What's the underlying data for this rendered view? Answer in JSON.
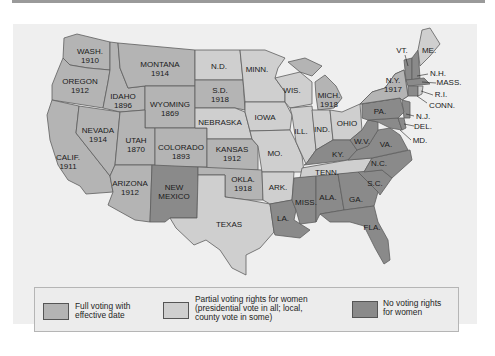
{
  "map": {
    "colors": {
      "full": "#b4b4b4",
      "partial": "#cfcfcf",
      "none": "#8a8a8a",
      "border": "#5e5e5e",
      "water": "#efefef",
      "lakes": "#f4f4f4"
    },
    "states": {
      "wash": {
        "name": "WASH.",
        "year": "1910",
        "status": "full"
      },
      "oregon": {
        "name": "OREGON",
        "year": "1912",
        "status": "full"
      },
      "calif": {
        "name": "CALIF.",
        "year": "1911",
        "status": "full"
      },
      "idaho": {
        "name": "IDAHO",
        "year": "1896",
        "status": "full"
      },
      "nevada": {
        "name": "NEVADA",
        "year": "1914",
        "status": "full"
      },
      "montana": {
        "name": "MONTANA",
        "year": "1914",
        "status": "full"
      },
      "wyoming": {
        "name": "WYOMING",
        "year": "1869",
        "status": "full"
      },
      "utah": {
        "name": "UTAH",
        "year": "1870",
        "status": "full"
      },
      "colorado": {
        "name": "COLORADO",
        "year": "1893",
        "status": "full"
      },
      "arizona": {
        "name": "ARIZONA",
        "year": "1912",
        "status": "full"
      },
      "new_mexico": {
        "name": "NEW MEXICO",
        "status": "none"
      },
      "nd": {
        "name": "N.D.",
        "status": "partial"
      },
      "sd": {
        "name": "S.D.",
        "year": "1918",
        "status": "full"
      },
      "nebraska": {
        "name": "NEBRASKA",
        "status": "partial"
      },
      "kansas": {
        "name": "KANSAS",
        "year": "1912",
        "status": "full"
      },
      "okla": {
        "name": "OKLA.",
        "year": "1918",
        "status": "full"
      },
      "texas": {
        "name": "TEXAS",
        "status": "partial"
      },
      "minn": {
        "name": "MINN.",
        "status": "partial"
      },
      "iowa": {
        "name": "IOWA",
        "status": "partial"
      },
      "mo": {
        "name": "MO.",
        "status": "partial"
      },
      "ark": {
        "name": "ARK.",
        "status": "partial"
      },
      "la": {
        "name": "LA.",
        "status": "none"
      },
      "wis": {
        "name": "WIS.",
        "status": "partial"
      },
      "ill": {
        "name": "ILL.",
        "status": "partial"
      },
      "mich": {
        "name": "MICH.",
        "year": "1918",
        "status": "full"
      },
      "ind": {
        "name": "IND.",
        "status": "partial"
      },
      "ohio": {
        "name": "OHIO",
        "status": "partial"
      },
      "ky": {
        "name": "KY.",
        "status": "none"
      },
      "tenn": {
        "name": "TENN.",
        "status": "partial"
      },
      "miss": {
        "name": "MISS.",
        "status": "none"
      },
      "ala": {
        "name": "ALA.",
        "status": "none"
      },
      "ga": {
        "name": "GA.",
        "status": "none"
      },
      "fla": {
        "name": "FLA.",
        "status": "none"
      },
      "sc": {
        "name": "S.C.",
        "status": "none"
      },
      "nc": {
        "name": "N.C.",
        "status": "none"
      },
      "va": {
        "name": "VA.",
        "status": "none"
      },
      "wv": {
        "name": "W.V.",
        "status": "none"
      },
      "md": {
        "name": "MD.",
        "status": "none"
      },
      "del": {
        "name": "DEL.",
        "status": "none"
      },
      "nj": {
        "name": "N.J.",
        "status": "none"
      },
      "pa": {
        "name": "PA.",
        "status": "none"
      },
      "ny": {
        "name": "N.Y.",
        "year": "1917",
        "status": "full"
      },
      "vt": {
        "name": "VT.",
        "status": "none"
      },
      "nh": {
        "name": "N.H.",
        "status": "none"
      },
      "me": {
        "name": "ME.",
        "status": "partial"
      },
      "mass": {
        "name": "MASS.",
        "status": "none"
      },
      "ri": {
        "name": "R.I.",
        "status": "partial"
      },
      "conn": {
        "name": "CONN.",
        "status": "none"
      }
    }
  },
  "legend": {
    "items": [
      {
        "key": "full",
        "label_line1": "Full voting with",
        "label_line2": "effective date"
      },
      {
        "key": "partial",
        "label_line1": "Partial voting rights for women",
        "label_line2": "(presidential vote in all; local,",
        "label_line3": "county vote in some)"
      },
      {
        "key": "none",
        "label_line1": "No voting rights",
        "label_line2": "for women"
      }
    ]
  }
}
